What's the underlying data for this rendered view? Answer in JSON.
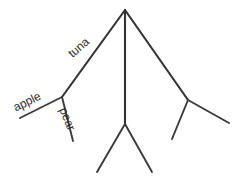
{
  "diagram": {
    "type": "tree",
    "background_color": "#ffffff",
    "stroke_color": "#333333",
    "text_color": "#2b2b2b",
    "labels": {
      "tuna": "tuna",
      "apple": "apple",
      "pear": "pear"
    },
    "nodes": [
      {
        "id": "root",
        "x": 125,
        "y": 10,
        "label": ""
      },
      {
        "id": "left-node",
        "x": 62,
        "y": 97,
        "label": ""
      },
      {
        "id": "apple-leaf",
        "x": 20,
        "y": 118,
        "label": "apple"
      },
      {
        "id": "pear-leaf",
        "x": 73,
        "y": 141,
        "label": "pear"
      },
      {
        "id": "center-node",
        "x": 125,
        "y": 124,
        "label": ""
      },
      {
        "id": "center-leaf-left",
        "x": 97,
        "y": 172,
        "label": ""
      },
      {
        "id": "center-leaf-right",
        "x": 152,
        "y": 172,
        "label": ""
      },
      {
        "id": "right-node",
        "x": 188,
        "y": 100,
        "label": ""
      },
      {
        "id": "right-leaf-left",
        "x": 172,
        "y": 139,
        "label": ""
      },
      {
        "id": "right-leaf-right",
        "x": 229,
        "y": 123,
        "label": ""
      }
    ],
    "edges": [
      {
        "from": "root",
        "to": "left-node",
        "label": "tuna"
      },
      {
        "from": "root",
        "to": "center-node",
        "label": ""
      },
      {
        "from": "root",
        "to": "right-node",
        "label": ""
      },
      {
        "from": "left-node",
        "to": "apple-leaf",
        "label": "apple"
      },
      {
        "from": "left-node",
        "to": "pear-leaf",
        "label": "pear"
      },
      {
        "from": "center-node",
        "to": "center-leaf-left",
        "label": ""
      },
      {
        "from": "center-node",
        "to": "center-leaf-right",
        "label": ""
      },
      {
        "from": "right-node",
        "to": "right-leaf-left",
        "label": ""
      },
      {
        "from": "right-node",
        "to": "right-leaf-right",
        "label": ""
      }
    ]
  }
}
